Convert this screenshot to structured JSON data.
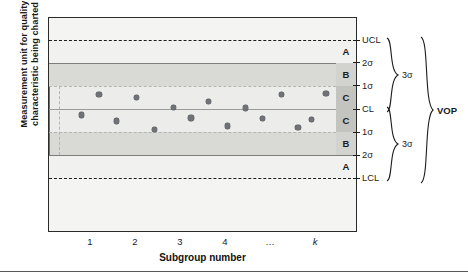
{
  "figure": {
    "kind": "control-chart-zone-diagram",
    "axis_titles": {
      "y_line1": "Measurement unit for quality",
      "y_line2": "characteristic being charted",
      "x": "Subgroup number"
    }
  },
  "chart_data": {
    "type": "scatter",
    "title": "",
    "xlabel": "Subgroup number",
    "ylabel": "Measurement unit for quality characteristic being charted",
    "grid": false,
    "legend": "none",
    "x": [
      "1",
      "2",
      "3",
      "4",
      "…",
      "k"
    ],
    "xtick_labels": [
      "1",
      "2",
      "3",
      "4",
      "…",
      "k"
    ],
    "ytick_labels": [
      "UCL",
      "2σ",
      "1σ",
      "CL",
      "1σ",
      "2σ",
      "LCL"
    ],
    "ylim_labels": [
      "LCL",
      "UCL"
    ],
    "reference_lines": [
      {
        "name": "UCL",
        "label": "UCL",
        "sigma": 3,
        "style": "dashed",
        "y_frac": 0.1116
      },
      {
        "name": "plus2sigma",
        "label": "2σ",
        "sigma": 2,
        "style": "solid",
        "y_frac": 0.2163
      },
      {
        "name": "plus1sigma",
        "label": "1σ",
        "sigma": 1,
        "style": "dotted",
        "y_frac": 0.3233
      },
      {
        "name": "CL",
        "label": "CL",
        "sigma": 0,
        "style": "solid",
        "y_frac": 0.4326
      },
      {
        "name": "minus1sigma",
        "label": "1σ",
        "sigma": -1,
        "style": "dotted",
        "y_frac": 0.5395
      },
      {
        "name": "minus2sigma",
        "label": "2σ",
        "sigma": -2,
        "style": "solid",
        "y_frac": 0.6465
      },
      {
        "name": "LCL",
        "label": "LCL",
        "sigma": -3,
        "style": "dashed",
        "y_frac": 0.7535
      }
    ],
    "zones": [
      {
        "letter": "A",
        "from": "UCL",
        "to": "2σ",
        "shade": "light"
      },
      {
        "letter": "B",
        "from": "2σ",
        "to": "1σ",
        "shade": "medium"
      },
      {
        "letter": "C",
        "from": "1σ",
        "to": "CL",
        "shade": "light"
      },
      {
        "letter": "C",
        "from": "CL",
        "to": "1σ",
        "shade": "light"
      },
      {
        "letter": "B",
        "from": "1σ",
        "to": "2σ",
        "shade": "medium"
      },
      {
        "letter": "A",
        "from": "2σ",
        "to": "LCL",
        "shade": "light"
      }
    ],
    "annotations": [
      {
        "name": "upper-3sigma",
        "label": "3σ",
        "spans": [
          "UCL",
          "CL"
        ]
      },
      {
        "name": "lower-3sigma",
        "label": "3σ",
        "spans": [
          "CL",
          "LCL"
        ]
      },
      {
        "name": "vop",
        "label": "VOP",
        "spans": [
          "UCL",
          "LCL"
        ]
      }
    ],
    "points": [
      {
        "i": 1,
        "x_frac": 0.075,
        "y_sigma": -0.25
      },
      {
        "i": 2,
        "x_frac": 0.14,
        "y_sigma": 0.62
      },
      {
        "i": 3,
        "x_frac": 0.205,
        "y_sigma": -0.52
      },
      {
        "i": 4,
        "x_frac": 0.278,
        "y_sigma": 0.48
      },
      {
        "i": 5,
        "x_frac": 0.343,
        "y_sigma": -0.88
      },
      {
        "i": 6,
        "x_frac": 0.415,
        "y_sigma": 0.07
      },
      {
        "i": 7,
        "x_frac": 0.478,
        "y_sigma": -0.38
      },
      {
        "i": 8,
        "x_frac": 0.543,
        "y_sigma": 0.32
      },
      {
        "i": 9,
        "x_frac": 0.612,
        "y_sigma": -0.72
      },
      {
        "i": 10,
        "x_frac": 0.678,
        "y_sigma": 0.05
      },
      {
        "i": 11,
        "x_frac": 0.742,
        "y_sigma": -0.4
      },
      {
        "i": 12,
        "x_frac": 0.812,
        "y_sigma": 0.62
      },
      {
        "i": 13,
        "x_frac": 0.872,
        "y_sigma": -0.78
      },
      {
        "i": 14,
        "x_frac": 0.922,
        "y_sigma": -0.45
      },
      {
        "i": 15,
        "x_frac": 0.975,
        "y_sigma": 0.65
      }
    ]
  },
  "colors": {
    "frame": "#2b2b2b",
    "plot_bg": "#f4f4f2",
    "zone_a": "#f1f1ef",
    "zone_b": "#d9d9d6",
    "zone_c": "#ececea",
    "zone_letter_c_bg": "#c3c3bf",
    "zone_letter_b_bg": "#d2d2ce",
    "point": "#6f7276",
    "text": "#1a1a1a"
  }
}
